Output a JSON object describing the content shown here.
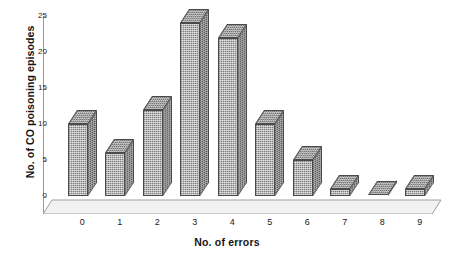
{
  "chart_data": {
    "type": "bar",
    "title": "",
    "subtitle": "",
    "xlabel": "No. of errors",
    "ylabel": "No. of CO poisoning episodes",
    "categories": [
      "0",
      "1",
      "2",
      "3",
      "4",
      "5",
      "6",
      "7",
      "8",
      "9"
    ],
    "values": [
      10,
      6,
      12,
      24,
      22,
      10,
      5,
      1,
      0,
      1
    ],
    "series": [
      {
        "name": "No. of CO poisoning episodes",
        "values": [
          10,
          6,
          12,
          24,
          22,
          10,
          5,
          1,
          0,
          1
        ]
      }
    ],
    "ylim": [
      0,
      25
    ],
    "ytick_labels": [
      "0",
      "5",
      "10",
      "15",
      "20",
      "25"
    ],
    "ytick_values": [
      0,
      5,
      10,
      15,
      20,
      25
    ],
    "grid": false,
    "legend": false,
    "legend_position": "none",
    "style": "3d-bar",
    "colors": {
      "bar_front": "#b6b6b6",
      "bar_side": "#8a8a8a",
      "bar_top": "#a5a5a5",
      "bar_outline": "#4a4a4a",
      "axis": "#9a9a9a",
      "floor": "#efefef",
      "text": "#1a1a1a",
      "background": "#ffffff"
    }
  }
}
